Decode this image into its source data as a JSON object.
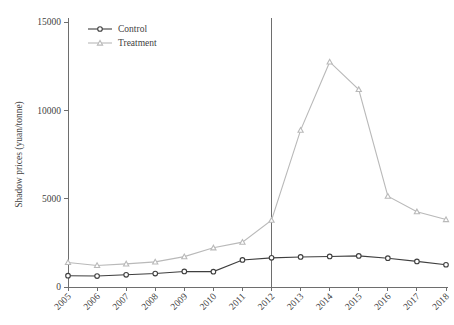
{
  "chart_data": {
    "type": "line",
    "title": "",
    "xlabel": "",
    "ylabel": "Shadow prices (yuan/tonne)",
    "x": [
      2005,
      2006,
      2007,
      2008,
      2009,
      2010,
      2011,
      2012,
      2013,
      2014,
      2015,
      2016,
      2017,
      2018
    ],
    "xtick_labels": [
      "2005",
      "2006",
      "2007",
      "2008",
      "2009",
      "2010",
      "2011",
      "2012",
      "2013",
      "2014",
      "2015",
      "2016",
      "2017",
      "2018"
    ],
    "ytick_labels": [
      "0",
      "5000",
      "10000",
      "15000"
    ],
    "yticks": [
      0,
      5000,
      10000,
      15000
    ],
    "ylim": [
      0,
      15000
    ],
    "xlim": [
      2005,
      2018
    ],
    "grid": false,
    "legend_position": "top-left",
    "series": [
      {
        "name": "Control",
        "color": "#3f3f3f",
        "marker": "circle",
        "values": [
          640,
          620,
          690,
          760,
          880,
          870,
          1530,
          1650,
          1700,
          1730,
          1760,
          1630,
          1450,
          1260
        ]
      },
      {
        "name": "Treatment",
        "color": "#b9b9b9",
        "marker": "triangle",
        "values": [
          1390,
          1220,
          1310,
          1420,
          1720,
          2220,
          2540,
          3780,
          8880,
          12740,
          11180,
          5140,
          4260,
          3820
        ]
      }
    ],
    "annotations": [
      {
        "name": "policy-reference-line",
        "type": "vline",
        "x": 2012,
        "color": "#6e6e6e"
      }
    ]
  },
  "legend": {
    "items": [
      {
        "label": "Control",
        "color": "#3f3f3f",
        "marker": "circle"
      },
      {
        "label": "Treatment",
        "color": "#b9b9b9",
        "marker": "triangle"
      }
    ]
  },
  "axes": {
    "y_title": "Shadow prices (yuan/tonne)"
  }
}
